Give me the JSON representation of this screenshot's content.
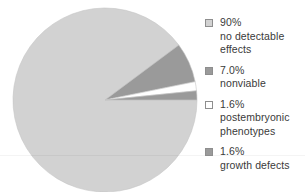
{
  "chart_data": {
    "type": "pie",
    "title": "",
    "subtitle": "",
    "xlabel": "",
    "ylabel": "",
    "grid": false,
    "legend_position": "right",
    "start_angle_deg": 0,
    "direction": "clockwise",
    "categories": [
      "no detectable effects",
      "nonviable",
      "postembryonic phenotypes",
      "growth defects"
    ],
    "values": [
      90,
      7.0,
      1.6,
      1.6
    ],
    "value_labels": [
      "90%",
      "7.0%",
      "1.6%",
      "1.6%"
    ],
    "colors": [
      "#d2d2d2",
      "#9a9a9a",
      "#ffffff",
      "#9a9a9a"
    ],
    "slices": [
      {
        "label": "no detectable effects",
        "value_label": "90%",
        "value": 90,
        "color": "#d2d2d2",
        "legend_label": "90%\nno detectable\neffects"
      },
      {
        "label": "nonviable",
        "value_label": "7.0%",
        "value": 7.0,
        "color": "#9a9a9a",
        "legend_label": "7.0%\nnonviable"
      },
      {
        "label": "postembryonic phenotypes",
        "value_label": "1.6%",
        "value": 1.6,
        "color": "#ffffff",
        "legend_label": "1.6%\npostembryonic\nphenotypes"
      },
      {
        "label": "growth defects",
        "value_label": "1.6%",
        "value": 1.6,
        "color": "#9a9a9a",
        "legend_label": "1.6%\ngrowth defects"
      }
    ]
  },
  "legend": {
    "entries": [
      {
        "text": "90%\nno detectable\neffects",
        "swatch_color": "#d2d2d2"
      },
      {
        "text": "7.0%\nnonviable",
        "swatch_color": "#9a9a9a"
      },
      {
        "text": "1.6%\npostembryonic\nphenotypes",
        "swatch_color": "#ffffff"
      },
      {
        "text": "1.6%\ngrowth defects",
        "swatch_color": "#9a9a9a"
      }
    ]
  },
  "style": {
    "background": "#ffffff",
    "text_color": "#3a3a3a",
    "slice_outline": "#c6c6c6"
  }
}
